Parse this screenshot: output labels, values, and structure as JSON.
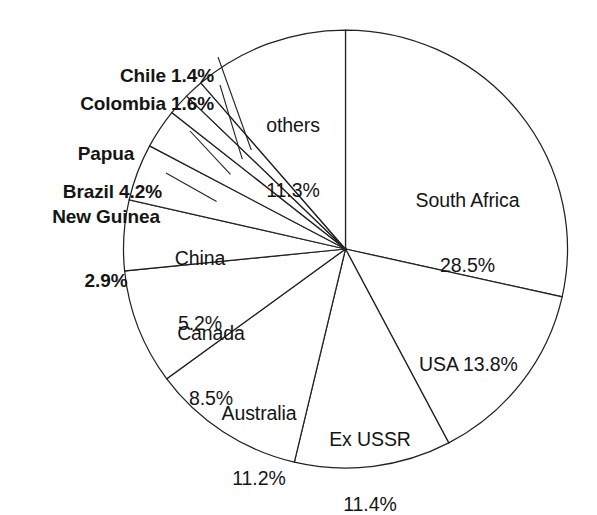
{
  "chart_data": {
    "type": "pie",
    "title": "",
    "subtitle": "",
    "xlabel": "",
    "ylabel": "",
    "legend_position": "none",
    "grid": false,
    "start_angle_deg": 0,
    "direction": "clockwise",
    "units": "percent",
    "categories": [
      "South Africa",
      "USA",
      "Ex USSR",
      "Australia",
      "Canada",
      "China",
      "Brazil",
      "Papua New Guinea",
      "Colombia",
      "Chile",
      "others"
    ],
    "values": [
      28.5,
      13.8,
      11.4,
      11.2,
      8.5,
      5.2,
      4.2,
      2.9,
      1.6,
      1.4,
      11.3
    ],
    "slices": [
      {
        "name": "South Africa",
        "value": 28.5,
        "label_line1": "South Africa",
        "label_line2": "28.5%",
        "label_style": "inside",
        "start_deg": 0.0,
        "end_deg": 102.6
      },
      {
        "name": "USA",
        "value": 13.8,
        "label_line1": "USA 13.8%",
        "label_line2": "",
        "label_style": "inside",
        "start_deg": 102.6,
        "end_deg": 152.28
      },
      {
        "name": "Ex USSR",
        "value": 11.4,
        "label_line1": "Ex USSR",
        "label_line2": "11.4%",
        "label_style": "inside",
        "start_deg": 152.28,
        "end_deg": 193.32
      },
      {
        "name": "Australia",
        "value": 11.2,
        "label_line1": "Australia",
        "label_line2": "11.2%",
        "label_style": "inside",
        "start_deg": 193.32,
        "end_deg": 233.64
      },
      {
        "name": "Canada",
        "value": 8.5,
        "label_line1": "Canada",
        "label_line2": "8.5%",
        "label_style": "inside",
        "start_deg": 233.64,
        "end_deg": 264.24
      },
      {
        "name": "China",
        "value": 5.2,
        "label_line1": "China",
        "label_line2": "5.2%",
        "label_style": "inside",
        "start_deg": 264.24,
        "end_deg": 282.96
      },
      {
        "name": "Brazil",
        "value": 4.2,
        "label_line1": "Brazil 4.2%",
        "label_line2": "",
        "label_style": "leader",
        "start_deg": 282.96,
        "end_deg": 298.08
      },
      {
        "name": "Papua New Guinea",
        "value": 2.9,
        "label_line1": "Papua",
        "label_line2": "New Guinea",
        "label_line3": "2.9%",
        "label_style": "leader",
        "start_deg": 298.08,
        "end_deg": 308.52
      },
      {
        "name": "Colombia",
        "value": 1.6,
        "label_line1": "Colombia 1.6%",
        "label_line2": "",
        "label_style": "leader",
        "start_deg": 308.52,
        "end_deg": 314.28
      },
      {
        "name": "Chile",
        "value": 1.4,
        "label_line1": "Chile 1.4%",
        "label_line2": "",
        "label_style": "leader",
        "start_deg": 314.28,
        "end_deg": 319.32
      },
      {
        "name": "others",
        "value": 11.3,
        "label_line1": "others",
        "label_line2": "11.3%",
        "label_style": "inside",
        "start_deg": 319.32,
        "end_deg": 360.0
      }
    ]
  },
  "labels": {
    "chile": {
      "line1": "Chile 1.4%"
    },
    "colombia": {
      "line1": "Colombia 1.6%"
    },
    "papua": {
      "line1": "Papua",
      "line2": "New Guinea",
      "line3": "2.9%"
    },
    "brazil": {
      "line1": "Brazil 4.2%"
    },
    "china": {
      "line1": "China",
      "line2": "5.2%"
    },
    "canada": {
      "line1": "Canada",
      "line2": "8.5%"
    },
    "australia": {
      "line1": "Australia",
      "line2": "11.2%"
    },
    "exussr": {
      "line1": "Ex USSR",
      "line2": "11.4%"
    },
    "usa": {
      "line1": "USA 13.8%"
    },
    "southafrica": {
      "line1": "South Africa",
      "line2": "28.5%"
    },
    "others": {
      "line1": "others",
      "line2": "11.3%"
    }
  },
  "colors": {
    "background": "#ffffff",
    "slice_fill": "#ffffff",
    "stroke": "#222222",
    "text": "#151515"
  }
}
